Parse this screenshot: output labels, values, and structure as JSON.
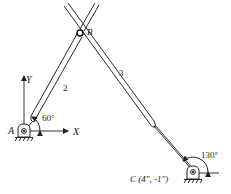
{
  "diagram": {
    "type": "four-bar linkage (slider-crank variant) kinematic sketch",
    "axes": {
      "x_label": "X",
      "y_label": "Y"
    },
    "points": {
      "A": {
        "label": "A"
      },
      "B": {
        "label": "B"
      },
      "C": {
        "label": "C",
        "coords_label": "C (4\", -1\")"
      }
    },
    "links": [
      {
        "id": "2",
        "label": "2"
      },
      {
        "id": "3",
        "label": "3"
      }
    ],
    "angles": {
      "link2_angle": "60°",
      "link_at_C_angle": "130°"
    },
    "colors": {
      "stroke": "#2a2a2a",
      "background": "#ffffff"
    }
  }
}
